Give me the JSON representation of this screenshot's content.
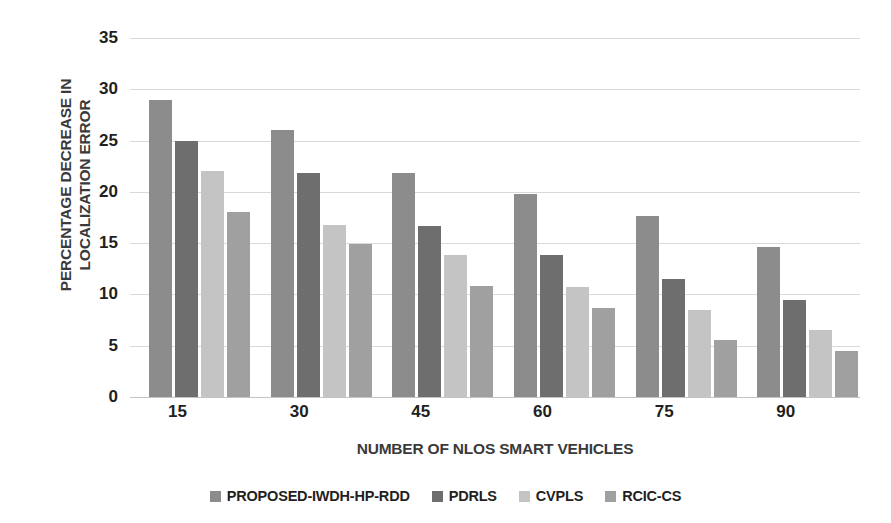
{
  "chart_data": {
    "type": "bar",
    "title": "",
    "xlabel": "NUMBER OF NLOS SMART VEHICLES",
    "ylabel": "PERCENTAGE DECREASE IN LOCALIZATION ERROR",
    "ylabel_line1": "PERCENTAGE DECREASE IN",
    "ylabel_line2": "LOCALIZATION ERROR",
    "categories": [
      "15",
      "30",
      "45",
      "60",
      "75",
      "90"
    ],
    "yticks": [
      "35",
      "30",
      "25",
      "20",
      "15",
      "10",
      "5",
      "0"
    ],
    "ylim": [
      0,
      35
    ],
    "grid": true,
    "legend_position": "bottom",
    "series": [
      {
        "name": "PROPOSED-IWDH-HP-RDD",
        "color": "#8c8c8c",
        "values": [
          29.0,
          26.0,
          21.8,
          19.8,
          17.6,
          14.6
        ]
      },
      {
        "name": "PDRLS",
        "color": "#6e6e6e",
        "values": [
          25.0,
          21.8,
          16.7,
          13.8,
          11.5,
          9.5
        ]
      },
      {
        "name": "CVPLS",
        "color": "#c4c4c4",
        "values": [
          22.0,
          16.8,
          13.8,
          10.7,
          8.5,
          6.5
        ]
      },
      {
        "name": "RCIC-CS",
        "color": "#a0a0a0",
        "values": [
          18.0,
          14.9,
          10.8,
          8.7,
          5.6,
          4.5
        ]
      }
    ]
  }
}
